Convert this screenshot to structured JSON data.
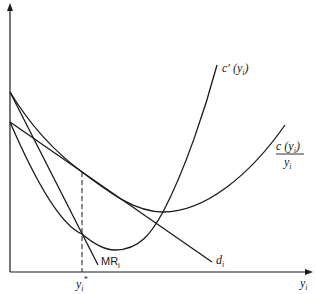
{
  "diagram": {
    "type": "monopolistic-competition-equilibrium",
    "axes": {
      "x_label": "y",
      "x_label_sub": "i",
      "y_label": ""
    },
    "curves": [
      {
        "id": "marginal-cost",
        "label": "c′ (y",
        "label_sub": "i",
        "label_close": ")"
      },
      {
        "id": "average-cost",
        "numerator": "c (y",
        "numerator_sub": "i",
        "numerator_close": ")",
        "denominator": "y",
        "denominator_sub": "i"
      },
      {
        "id": "demand",
        "label": "d",
        "label_sub": "i"
      },
      {
        "id": "marginal-revenue",
        "label": "MR",
        "label_sub": "i"
      }
    ],
    "equilibrium": {
      "label": "y",
      "label_sub": "i",
      "label_sup": "*"
    },
    "colors": {
      "stroke": "#1a1a1a",
      "background": "#ffffff"
    }
  }
}
